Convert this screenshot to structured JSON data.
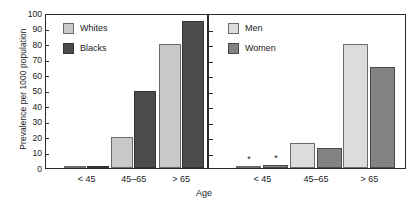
{
  "chart_data": {
    "type": "bar",
    "title": "",
    "xlabel": "Age",
    "ylabel": "Prevalence per 1000 population",
    "ylim": [
      0,
      100
    ],
    "yticks": [
      0,
      10,
      20,
      30,
      40,
      50,
      60,
      70,
      80,
      90,
      100
    ],
    "grid": false,
    "legend_position": "inside-top-left",
    "categories": [
      "< 45",
      "45–65",
      "> 65"
    ],
    "panels": [
      {
        "name": "race-panel",
        "legend": [
          "Whites",
          "Blacks"
        ],
        "series": [
          {
            "name": "Whites",
            "color": "#c9c9c9",
            "values": [
              1,
              20,
              80
            ],
            "annotations": [
              "",
              "",
              ""
            ]
          },
          {
            "name": "Blacks",
            "color": "#4b4b4b",
            "values": [
              1.5,
              50,
              95
            ],
            "annotations": [
              "",
              "",
              ""
            ]
          }
        ]
      },
      {
        "name": "sex-panel",
        "legend": [
          "Men",
          "Women"
        ],
        "series": [
          {
            "name": "Men",
            "color": "#dcdcdc",
            "values": [
              1.5,
              16,
              80
            ],
            "annotations": [
              "*",
              "",
              ""
            ]
          },
          {
            "name": "Women",
            "color": "#838383",
            "values": [
              2,
              13,
              65
            ],
            "annotations": [
              "*",
              "",
              ""
            ]
          }
        ]
      }
    ]
  },
  "axis": {
    "y_title": "Prevalence per 1000 population",
    "x_title": "Age",
    "y_tick_labels": [
      "100",
      "90",
      "80",
      "70",
      "60",
      "50",
      "40",
      "30",
      "20",
      "10",
      "0"
    ]
  },
  "left_panel": {
    "legend": {
      "series0_label": "Whites",
      "series1_label": "Blacks"
    },
    "xticks": [
      "< 45",
      "45–65",
      "> 65"
    ]
  },
  "right_panel": {
    "legend": {
      "series0_label": "Men",
      "series1_label": "Women"
    },
    "xticks": [
      "< 45",
      "45–65",
      "> 65"
    ],
    "annotations": {
      "star0": "*",
      "star1": "*"
    }
  },
  "colors": {
    "whites": "#c9c9c9",
    "blacks": "#4b4b4b",
    "men": "#dcdcdc",
    "women": "#838383",
    "axis": "#2a2a2a"
  }
}
